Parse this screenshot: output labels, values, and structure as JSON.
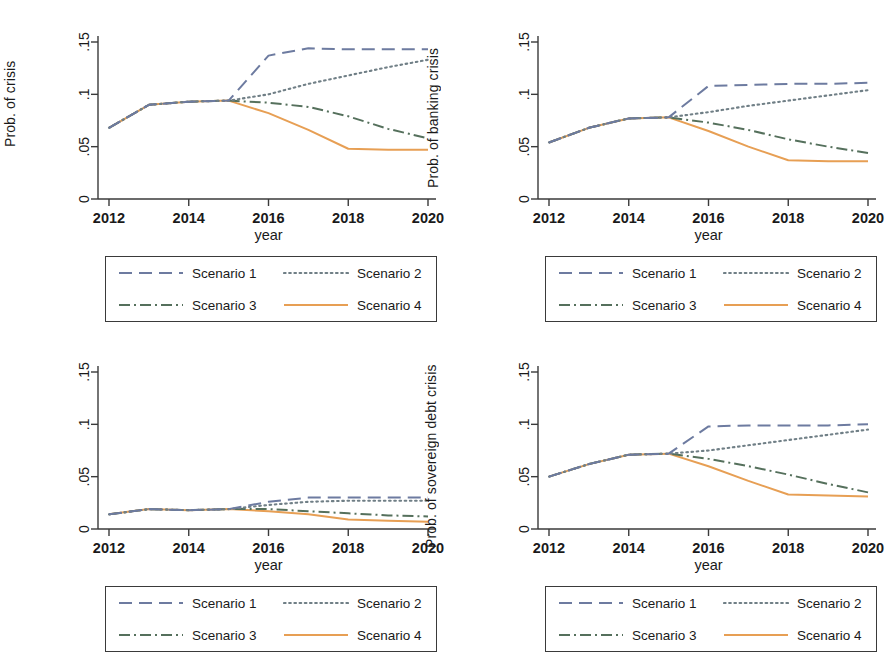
{
  "figure": {
    "xlabel": "year",
    "xticks": [
      "2012",
      "2014",
      "2016",
      "2018",
      "2020"
    ],
    "yticks": [
      "0",
      ".05",
      ".1",
      ".15"
    ],
    "legend_labels": [
      "Scenario 1",
      "Scenario 2",
      "Scenario 3",
      "Scenario 4"
    ],
    "colors": {
      "scenario1": "#6d7ba0",
      "scenario2": "#707f86",
      "scenario3": "#55705c",
      "scenario4": "#e79f54",
      "axis": "#3a3a3a",
      "text": "#1a1a1a"
    }
  },
  "panels": {
    "top_left": {
      "ylabel": "Prob. of crisis",
      "ylabel_side": "left"
    },
    "top_right": {
      "ylabel": "Prob. of banking crisis",
      "ylabel_side": "left-of-panel"
    },
    "bottom_left": {
      "ylabel": "",
      "ylabel_side": "none"
    },
    "bottom_right": {
      "ylabel": "Prob. of sovereign debt crisis",
      "ylabel_side": "left-of-panel"
    }
  },
  "chart_data": [
    {
      "type": "line",
      "panel": "top_left",
      "title": "",
      "xlabel": "year",
      "ylabel": "Prob. of crisis",
      "x": [
        2012,
        2013,
        2014,
        2015,
        2016,
        2017,
        2018,
        2019,
        2020
      ],
      "xlim": [
        2012,
        2020
      ],
      "ylim": [
        0,
        0.16
      ],
      "yticks": [
        0,
        0.05,
        0.1,
        0.15
      ],
      "grid": false,
      "legend_position": "below",
      "series": [
        {
          "name": "Scenario 1",
          "style": "dashed",
          "color": "#6d7ba0",
          "values": [
            0.068,
            0.09,
            0.093,
            0.094,
            0.137,
            0.144,
            0.143,
            0.143,
            0.143
          ]
        },
        {
          "name": "Scenario 2",
          "style": "dotted",
          "color": "#707f86",
          "values": [
            0.068,
            0.09,
            0.093,
            0.094,
            0.1,
            0.11,
            0.118,
            0.126,
            0.133
          ]
        },
        {
          "name": "Scenario 3",
          "style": "dashdot",
          "color": "#55705c",
          "values": [
            0.068,
            0.09,
            0.093,
            0.094,
            0.092,
            0.088,
            0.079,
            0.067,
            0.058
          ]
        },
        {
          "name": "Scenario 4",
          "style": "solid",
          "color": "#e79f54",
          "values": [
            0.068,
            0.09,
            0.093,
            0.094,
            0.082,
            0.066,
            0.048,
            0.047,
            0.047
          ]
        }
      ]
    },
    {
      "type": "line",
      "panel": "top_right",
      "title": "",
      "xlabel": "year",
      "ylabel": "Prob. of banking crisis",
      "x": [
        2012,
        2013,
        2014,
        2015,
        2016,
        2017,
        2018,
        2019,
        2020
      ],
      "xlim": [
        2012,
        2020
      ],
      "ylim": [
        0,
        0.16
      ],
      "yticks": [
        0,
        0.05,
        0.1,
        0.15
      ],
      "grid": false,
      "legend_position": "below",
      "series": [
        {
          "name": "Scenario 1",
          "style": "dashed",
          "color": "#6d7ba0",
          "values": [
            0.054,
            0.068,
            0.077,
            0.078,
            0.108,
            0.109,
            0.11,
            0.11,
            0.111
          ]
        },
        {
          "name": "Scenario 2",
          "style": "dotted",
          "color": "#707f86",
          "values": [
            0.054,
            0.068,
            0.077,
            0.078,
            0.083,
            0.089,
            0.094,
            0.099,
            0.104
          ]
        },
        {
          "name": "Scenario 3",
          "style": "dashdot",
          "color": "#55705c",
          "values": [
            0.054,
            0.068,
            0.077,
            0.078,
            0.073,
            0.066,
            0.057,
            0.05,
            0.044
          ]
        },
        {
          "name": "Scenario 4",
          "style": "solid",
          "color": "#e79f54",
          "values": [
            0.054,
            0.068,
            0.077,
            0.078,
            0.065,
            0.05,
            0.037,
            0.036,
            0.036
          ]
        }
      ]
    },
    {
      "type": "line",
      "panel": "bottom_left",
      "title": "",
      "xlabel": "year",
      "ylabel": "",
      "x": [
        2012,
        2013,
        2014,
        2015,
        2016,
        2017,
        2018,
        2019,
        2020
      ],
      "xlim": [
        2012,
        2020
      ],
      "ylim": [
        0,
        0.16
      ],
      "yticks": [
        0,
        0.05,
        0.1,
        0.15
      ],
      "grid": false,
      "legend_position": "below",
      "series": [
        {
          "name": "Scenario 1",
          "style": "dashed",
          "color": "#6d7ba0",
          "values": [
            0.014,
            0.019,
            0.018,
            0.019,
            0.026,
            0.03,
            0.03,
            0.03,
            0.03
          ]
        },
        {
          "name": "Scenario 2",
          "style": "dotted",
          "color": "#707f86",
          "values": [
            0.014,
            0.019,
            0.018,
            0.019,
            0.023,
            0.026,
            0.027,
            0.027,
            0.027
          ]
        },
        {
          "name": "Scenario 3",
          "style": "dashdot",
          "color": "#55705c",
          "values": [
            0.014,
            0.019,
            0.018,
            0.019,
            0.019,
            0.017,
            0.015,
            0.013,
            0.012
          ]
        },
        {
          "name": "Scenario 4",
          "style": "solid",
          "color": "#e79f54",
          "values": [
            0.014,
            0.019,
            0.018,
            0.019,
            0.017,
            0.014,
            0.009,
            0.008,
            0.007
          ]
        }
      ]
    },
    {
      "type": "line",
      "panel": "bottom_right",
      "title": "",
      "xlabel": "year",
      "ylabel": "Prob. of sovereign debt crisis",
      "x": [
        2012,
        2013,
        2014,
        2015,
        2016,
        2017,
        2018,
        2019,
        2020
      ],
      "xlim": [
        2012,
        2020
      ],
      "ylim": [
        0,
        0.16
      ],
      "yticks": [
        0,
        0.05,
        0.1,
        0.15
      ],
      "grid": false,
      "legend_position": "below",
      "series": [
        {
          "name": "Scenario 1",
          "style": "dashed",
          "color": "#6d7ba0",
          "values": [
            0.05,
            0.062,
            0.071,
            0.072,
            0.098,
            0.099,
            0.099,
            0.099,
            0.1
          ]
        },
        {
          "name": "Scenario 2",
          "style": "dotted",
          "color": "#707f86",
          "values": [
            0.05,
            0.062,
            0.071,
            0.072,
            0.075,
            0.08,
            0.085,
            0.09,
            0.095
          ]
        },
        {
          "name": "Scenario 3",
          "style": "dashdot",
          "color": "#55705c",
          "values": [
            0.05,
            0.062,
            0.071,
            0.072,
            0.067,
            0.06,
            0.052,
            0.043,
            0.035
          ]
        },
        {
          "name": "Scenario 4",
          "style": "solid",
          "color": "#e79f54",
          "values": [
            0.05,
            0.062,
            0.071,
            0.072,
            0.06,
            0.046,
            0.033,
            0.032,
            0.031
          ]
        }
      ]
    }
  ]
}
